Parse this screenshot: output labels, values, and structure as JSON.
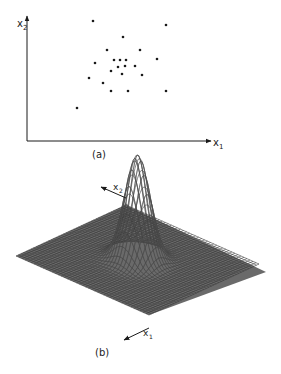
{
  "panels": {
    "a": {
      "caption": "(a)",
      "x_axis_label": "x",
      "x_axis_sub": "1",
      "y_axis_label": "x",
      "y_axis_sub": "2"
    },
    "b": {
      "caption": "(b)",
      "axis1_label": "x",
      "axis1_sub": "1",
      "axis2_label": "x",
      "axis2_sub": "2"
    }
  },
  "colors": {
    "ink": "#1a1a1a",
    "mesh": "#3a3a3a",
    "background": "#ffffff"
  },
  "chart_data": [
    {
      "type": "scatter",
      "title": "(a)",
      "xlabel": "x1",
      "ylabel": "x2",
      "grid": false,
      "points": [
        [
          93,
          21
        ],
        [
          166,
          25
        ],
        [
          123,
          37
        ],
        [
          107,
          50
        ],
        [
          140,
          50
        ],
        [
          157,
          59
        ],
        [
          95,
          63
        ],
        [
          114,
          60
        ],
        [
          120,
          60
        ],
        [
          126,
          60
        ],
        [
          118,
          67
        ],
        [
          125,
          66
        ],
        [
          135,
          66
        ],
        [
          111,
          71
        ],
        [
          142,
          75
        ],
        [
          122,
          74
        ],
        [
          89,
          78
        ],
        [
          103,
          83
        ],
        [
          111,
          91
        ],
        [
          128,
          91
        ],
        [
          166,
          91
        ],
        [
          77,
          108
        ]
      ]
    },
    {
      "type": "surface",
      "title": "(b)",
      "axes": [
        "x1",
        "x2"
      ],
      "description": "Bivariate Gaussian probability density surface on a square mesh grid, single peak at center"
    }
  ]
}
